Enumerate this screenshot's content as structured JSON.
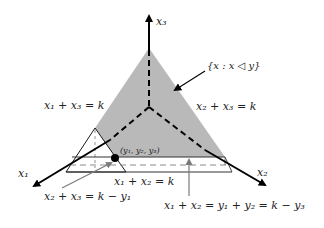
{
  "diagram": {
    "type": "simplex-3d-axes",
    "colors": {
      "region_fill": "#b9b9b9",
      "axis": "#000000",
      "gray_arrow": "#7a7a7a",
      "band_dashed": "#8c8c8c",
      "point": "#000000"
    },
    "axes": {
      "x1": "x₁",
      "x2": "x₂",
      "x3": "x₃"
    },
    "labels": {
      "region": "{x : x ◁ y}",
      "plane_13": "x₁ + x₃ = k",
      "plane_23": "x₂ + x₃ = k",
      "plane_12": "x₁ + x₂ = k",
      "point": "(y₁, y₂, y₃)",
      "line_23_shift": "x₂ + x₃ = k − y₁",
      "line_12_shift": "x₁ + x₂ = y₁ + y₂ = k − y₃"
    }
  }
}
